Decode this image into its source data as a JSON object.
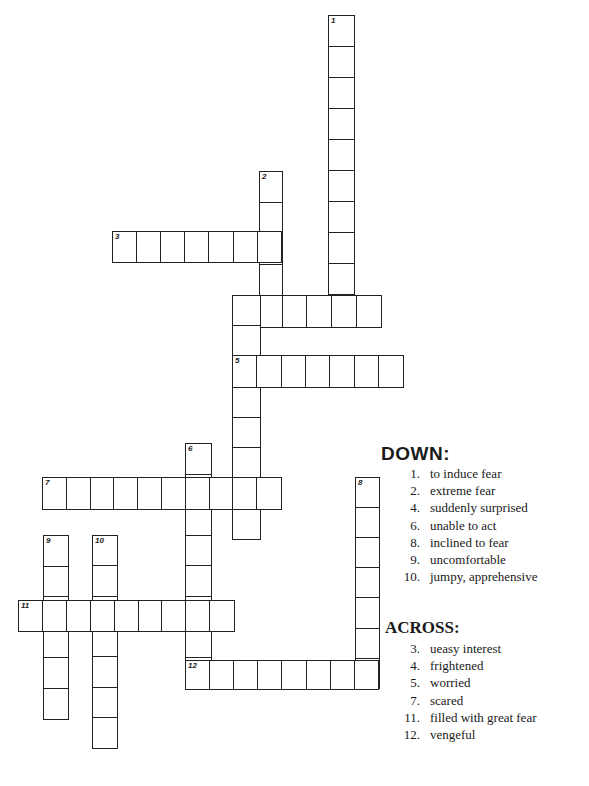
{
  "puzzle": {
    "words": [
      {
        "id": "1-down",
        "number": "1",
        "dir": "down",
        "x": 328,
        "y": 15,
        "len": 10,
        "cw": 25,
        "ch": 31
      },
      {
        "id": "2-down",
        "number": "2",
        "dir": "down",
        "x": 259,
        "y": 171,
        "len": 5,
        "cw": 22,
        "ch": 31
      },
      {
        "id": "3-across",
        "number": "3",
        "dir": "across",
        "x": 112,
        "y": 231,
        "len": 7,
        "cw": 24.1,
        "ch": 30
      },
      {
        "id": "4-across",
        "number": "4",
        "dir": "across",
        "x": 232,
        "y": 295,
        "len": 6,
        "cw": 24.8,
        "ch": 31
      },
      {
        "id": "4-down",
        "number": "",
        "dir": "down",
        "x": 232,
        "y": 295,
        "len": 8,
        "cw": 27,
        "ch": 30.4
      },
      {
        "id": "5-across",
        "number": "5",
        "dir": "across",
        "x": 232,
        "y": 355,
        "len": 7,
        "cw": 24.3,
        "ch": 31
      },
      {
        "id": "6-down",
        "number": "6",
        "dir": "down",
        "x": 185,
        "y": 443,
        "len": 8,
        "cw": 25,
        "ch": 30.6
      },
      {
        "id": "7-across",
        "number": "7",
        "dir": "across",
        "x": 42,
        "y": 477,
        "len": 10,
        "cw": 23.8,
        "ch": 31
      },
      {
        "id": "8-down",
        "number": "8",
        "dir": "down",
        "x": 355,
        "y": 477,
        "len": 7,
        "cw": 23,
        "ch": 30.1
      },
      {
        "id": "9-down",
        "number": "9",
        "dir": "down",
        "x": 43,
        "y": 535,
        "len": 6,
        "cw": 24,
        "ch": 30.5
      },
      {
        "id": "10-down",
        "number": "10",
        "dir": "down",
        "x": 92,
        "y": 535,
        "len": 7,
        "cw": 24,
        "ch": 30.3
      },
      {
        "id": "11-across",
        "number": "11",
        "dir": "across",
        "x": 18,
        "y": 600,
        "len": 9,
        "cw": 23.9,
        "ch": 30
      },
      {
        "id": "12-across",
        "number": "12",
        "dir": "across",
        "x": 185,
        "y": 660,
        "len": 8,
        "cw": 24.1,
        "ch": 28
      }
    ]
  },
  "clues": {
    "down_heading": "DOWN:",
    "down": [
      {
        "number": "1.",
        "text": "to induce fear"
      },
      {
        "number": "2.",
        "text": "extreme fear"
      },
      {
        "number": "4.",
        "text": "suddenly surprised"
      },
      {
        "number": "6.",
        "text": "unable to act"
      },
      {
        "number": "8.",
        "text": "inclined to fear"
      },
      {
        "number": "9.",
        "text": "uncomfortable"
      },
      {
        "number": "10.",
        "text": "jumpy, apprehensive"
      }
    ],
    "across_heading": "ACROSS:",
    "across": [
      {
        "number": "3.",
        "text": "ueasy interest"
      },
      {
        "number": "4.",
        "text": "frightened"
      },
      {
        "number": "5.",
        "text": "worried"
      },
      {
        "number": "7.",
        "text": "scared"
      },
      {
        "number": "11.",
        "text": "filled with great fear"
      },
      {
        "number": "12.",
        "text": "vengeful"
      }
    ]
  }
}
